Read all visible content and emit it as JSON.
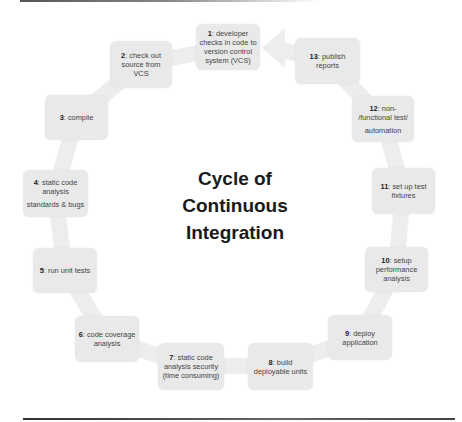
{
  "diagram": {
    "title_lines": [
      "Cycle of",
      "Continuous",
      "Integration"
    ],
    "colors": {
      "box_fill": "#e9e9e9",
      "connector": "#eeeeee",
      "text": "#444444",
      "title": "#1a1a1a"
    },
    "steps": [
      {
        "num": "1",
        "text_lines": [
          "developer",
          "checks in code to",
          "version control",
          "system (VCS)"
        ]
      },
      {
        "num": "2",
        "text_lines": [
          "check out",
          "source from VCS"
        ]
      },
      {
        "num": "3",
        "text_lines": [
          "compile"
        ]
      },
      {
        "num": "4",
        "text_lines": [
          "static code",
          "analysis"
        ],
        "extra": "standards & bugs"
      },
      {
        "num": "5",
        "text_lines": [
          "run unit tests"
        ]
      },
      {
        "num": "6",
        "text_lines": [
          "code coverage",
          "analysis"
        ]
      },
      {
        "num": "7",
        "text_lines": [
          "static code",
          "analysis security",
          "(time consuming)"
        ]
      },
      {
        "num": "8",
        "text_lines": [
          "build",
          "deployable units"
        ]
      },
      {
        "num": "9",
        "text_lines": [
          "deploy",
          "application"
        ]
      },
      {
        "num": "10",
        "text_lines": [
          "setup",
          "performance",
          "analysis"
        ]
      },
      {
        "num": "11",
        "text_lines": [
          "set up test",
          "fixtures"
        ]
      },
      {
        "num": "12",
        "text_lines": [
          "non-",
          "/functional test/"
        ],
        "extra": "automation"
      },
      {
        "num": "13",
        "text_lines": [
          "publish",
          "reports"
        ]
      }
    ]
  }
}
